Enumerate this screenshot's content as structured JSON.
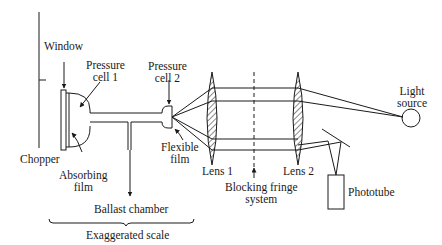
{
  "diagram": {
    "colors": {
      "ink": "#1a1a1a",
      "background": "#ffffff"
    },
    "labels": {
      "window": "Window",
      "pressure_cell_1": [
        "Pressure",
        "cell 1"
      ],
      "pressure_cell_2": [
        "Pressure",
        "cell 2"
      ],
      "chopper": "Chopper",
      "absorbing_film": [
        "Absorbing",
        "film"
      ],
      "flexible_film": [
        "Flexible",
        "film"
      ],
      "lens_1": "Lens 1",
      "lens_2": "Lens 2",
      "blocking_fringe_system": [
        "Blocking fringe",
        "system"
      ],
      "light_source": [
        "Light",
        "source"
      ],
      "phototube": "Phototube",
      "ballast_chamber": "Ballast chamber",
      "exaggerated_scale": "Exaggerated scale"
    }
  }
}
